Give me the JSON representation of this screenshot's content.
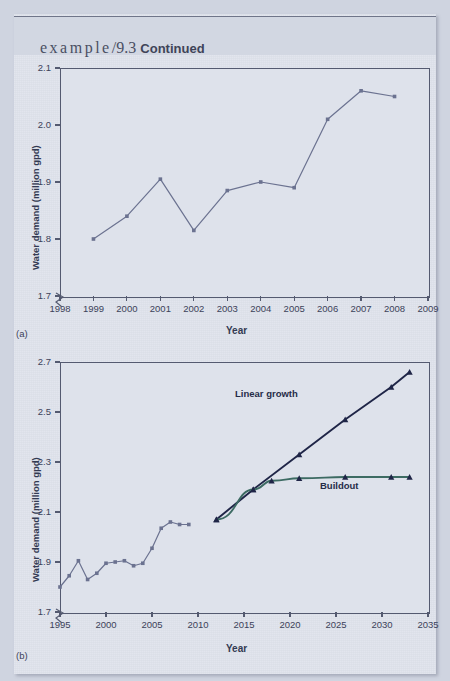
{
  "header": {
    "example_word": "example",
    "slash": "/",
    "number": "9.3",
    "continued": "Continued"
  },
  "colors": {
    "page_background": "#dfe3ec",
    "outer_background": "#cfd4e0",
    "header_band": "#d2d7e2",
    "axis": "#545a70",
    "historic_line": "#6b7290",
    "projection_dark": "#1f2547",
    "buildout_line": "#3d6b63",
    "text": "#3c4259",
    "label_bold": "#333a52"
  },
  "charts": [
    {
      "panel_label": "(a)",
      "xlabel": "Year",
      "ylabel": "Water demand (million gpd)",
      "yticks": [
        "2.1",
        "2.0",
        "1.9",
        "1.8",
        "1.7"
      ],
      "xticks": [
        "1998",
        "1999",
        "2000",
        "2001",
        "2002",
        "2003",
        "2004",
        "2005",
        "2006",
        "2007",
        "2008",
        "2009"
      ],
      "axis_break": true
    },
    {
      "panel_label": "(b)",
      "xlabel": "Year",
      "ylabel": "Water demand (million gpd)",
      "yticks": [
        "2.7",
        "2.5",
        "2.3",
        "2.1",
        "1.9",
        "1.7"
      ],
      "xticks": [
        "1995",
        "2000",
        "2005",
        "2010",
        "2015",
        "2020",
        "2025",
        "2030",
        "2035"
      ],
      "axis_break": true,
      "annotations": [
        {
          "text": "Linear growth"
        },
        {
          "text": "Buildout"
        }
      ]
    }
  ],
  "chart_data": [
    {
      "type": "line",
      "panel": "(a)",
      "title": "",
      "xlabel": "Year",
      "ylabel": "Water demand (million gpd)",
      "xlim": [
        1998,
        2009
      ],
      "ylim": [
        1.7,
        2.1
      ],
      "ytick_values": [
        1.7,
        1.8,
        1.9,
        2.0,
        2.1
      ],
      "xtick_values": [
        1998,
        1999,
        2000,
        2001,
        2002,
        2003,
        2004,
        2005,
        2006,
        2007,
        2008,
        2009
      ],
      "y_axis_broken_below": 1.7,
      "grid": false,
      "legend": "none",
      "series": [
        {
          "name": "Water demand (historical)",
          "marker": "square",
          "color": "#6b7290",
          "x": [
            1999,
            2000,
            2001,
            2002,
            2003,
            2004,
            2005,
            2006,
            2007,
            2008
          ],
          "values": [
            1.8,
            1.84,
            1.905,
            1.815,
            1.885,
            1.9,
            1.89,
            2.01,
            2.06,
            2.05
          ]
        }
      ]
    },
    {
      "type": "line",
      "panel": "(b)",
      "title": "",
      "xlabel": "Year",
      "ylabel": "Water demand (million gpd)",
      "xlim": [
        1995,
        2035
      ],
      "ylim": [
        1.7,
        2.7
      ],
      "ytick_values": [
        1.7,
        1.9,
        2.1,
        2.3,
        2.5,
        2.7
      ],
      "xtick_values": [
        1995,
        2000,
        2005,
        2010,
        2015,
        2020,
        2025,
        2030,
        2035
      ],
      "y_axis_broken_below": 1.7,
      "grid": false,
      "legend": "inline-annotations",
      "series": [
        {
          "name": "Water demand (historical)",
          "marker": "square",
          "color": "#6b7290",
          "x": [
            1995,
            1996,
            1997,
            1998,
            1999,
            2000,
            2001,
            2002,
            2003,
            2004,
            2005,
            2006,
            2007,
            2008,
            2009
          ],
          "values": [
            1.8,
            1.845,
            1.905,
            1.83,
            1.855,
            1.895,
            1.9,
            1.905,
            1.885,
            1.895,
            1.955,
            2.035,
            2.06,
            2.05,
            2.05
          ]
        },
        {
          "name": "Linear growth",
          "marker": "triangle",
          "color": "#1f2547",
          "x": [
            2012,
            2016,
            2021,
            2026,
            2031,
            2033
          ],
          "values": [
            2.07,
            2.19,
            2.33,
            2.47,
            2.6,
            2.66
          ]
        },
        {
          "name": "Buildout",
          "marker": "triangle",
          "color": "#3d6b63",
          "x": [
            2012,
            2016,
            2018,
            2021,
            2026,
            2031,
            2033
          ],
          "values": [
            2.07,
            2.19,
            2.225,
            2.235,
            2.24,
            2.24,
            2.24
          ]
        }
      ]
    }
  ]
}
